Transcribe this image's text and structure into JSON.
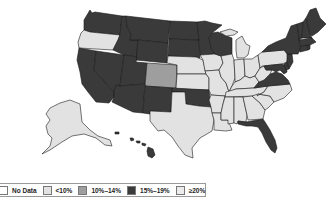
{
  "map": {
    "region": "United States",
    "colors": {
      "no_data": "#ffffff",
      "lt10": "#e2e2e2",
      "10_14": "#9e9e9e",
      "15_19": "#3a3a3a",
      "ge20": "#e8e8e8"
    },
    "states": {
      "WA": "15_19",
      "OR": "lt10",
      "CA": "15_19",
      "NV": "15_19",
      "ID": "15_19",
      "MT": "15_19",
      "WY": "15_19",
      "UT": "15_19",
      "AZ": "15_19",
      "CO": "10_14",
      "NM": "15_19",
      "ND": "15_19",
      "SD": "15_19",
      "NE": "lt10",
      "KS": "lt10",
      "OK": "15_19",
      "TX": "lt10",
      "MN": "15_19",
      "IA": "lt10",
      "MO": "lt10",
      "AR": "lt10",
      "LA": "lt10",
      "WI": "15_19",
      "IL": "lt10",
      "MI": "lt10",
      "IN": "lt10",
      "OH": "lt10",
      "KY": "lt10",
      "TN": "lt10",
      "MS": "lt10",
      "AL": "lt10",
      "GA": "lt10",
      "FL": "15_19",
      "SC": "lt10",
      "NC": "lt10",
      "VA": "15_19",
      "WV": "lt10",
      "PA": "lt10",
      "NY": "15_19",
      "VT": "15_19",
      "NH": "15_19",
      "ME": "15_19",
      "MA": "15_19",
      "CT": "15_19",
      "RI": "15_19",
      "NJ": "15_19",
      "DE": "15_19",
      "MD": "15_19",
      "AK": "lt10",
      "HI": "15_19"
    }
  },
  "legend": {
    "items": [
      {
        "label": "No Data",
        "color": "#ffffff"
      },
      {
        "label": "<10%",
        "color": "#e2e2e2"
      },
      {
        "label": "10%–14%",
        "color": "#9e9e9e"
      },
      {
        "label": "15%–19%",
        "color": "#3a3a3a"
      },
      {
        "label": "≥20%",
        "color": "#ececec"
      }
    ]
  }
}
